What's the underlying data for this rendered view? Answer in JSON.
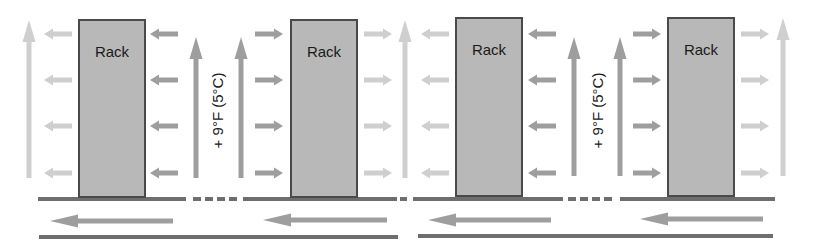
{
  "diagram": {
    "colors": {
      "rack_fill": "#b8b8b8",
      "rack_border": "#4a4a4a",
      "arrow_dark": "#9e9e9e",
      "arrow_light": "#cfcfcf",
      "floor_line": "#6e6e6e"
    },
    "racks": [
      {
        "label": "Rack",
        "x": 78,
        "y": 19,
        "w": 68,
        "h": 179,
        "intake_side": "right",
        "exhaust_side": "left"
      },
      {
        "label": "Rack",
        "x": 290,
        "y": 19,
        "w": 68,
        "h": 179,
        "intake_side": "left",
        "exhaust_side": "right"
      },
      {
        "label": "Rack",
        "x": 455,
        "y": 17,
        "w": 68,
        "h": 180,
        "intake_side": "right",
        "exhaust_side": "left"
      },
      {
        "label": "Rack",
        "x": 667,
        "y": 17,
        "w": 68,
        "h": 180,
        "intake_side": "left",
        "exhaust_side": "right"
      }
    ],
    "temperature_labels": [
      {
        "text": "+ 9°F (5°C)",
        "cx": 218,
        "cy": 110
      },
      {
        "text": "+ 9°F (5°C)",
        "cx": 598,
        "cy": 110
      }
    ],
    "horizontal_arrows": {
      "rows_y": [
        34,
        80,
        126,
        173
      ],
      "groups": [
        {
          "x1": 72,
          "x2": 44,
          "shade": "light",
          "direction": "left"
        },
        {
          "x1": 178,
          "x2": 150,
          "shade": "dark",
          "direction": "left"
        },
        {
          "x1": 255,
          "x2": 283,
          "shade": "dark",
          "direction": "right"
        },
        {
          "x1": 364,
          "x2": 392,
          "shade": "light",
          "direction": "right"
        },
        {
          "x1": 449,
          "x2": 421,
          "shade": "light",
          "direction": "left"
        },
        {
          "x1": 556,
          "x2": 528,
          "shade": "dark",
          "direction": "left"
        },
        {
          "x1": 633,
          "x2": 661,
          "shade": "dark",
          "direction": "right"
        },
        {
          "x1": 741,
          "x2": 769,
          "shade": "light",
          "direction": "right"
        }
      ]
    },
    "vertical_arrows": [
      {
        "x": 29,
        "y_bottom": 178,
        "y_top": 20,
        "shade": "light"
      },
      {
        "x": 196,
        "y_bottom": 178,
        "y_top": 37,
        "shade": "dark"
      },
      {
        "x": 241,
        "y_bottom": 178,
        "y_top": 37,
        "shade": "dark"
      },
      {
        "x": 405,
        "y_bottom": 178,
        "y_top": 20,
        "shade": "light"
      },
      {
        "x": 574,
        "y_bottom": 176,
        "y_top": 37,
        "shade": "dark"
      },
      {
        "x": 620,
        "y_bottom": 176,
        "y_top": 37,
        "shade": "dark"
      },
      {
        "x": 783,
        "y_bottom": 176,
        "y_top": 18,
        "shade": "light"
      }
    ],
    "floor": {
      "y": 199,
      "solid_segments": [
        [
          38,
          186
        ],
        [
          243,
          397
        ],
        [
          413,
          563
        ],
        [
          620,
          775
        ]
      ],
      "dashes": [
        [
          193,
          201
        ],
        [
          205,
          213
        ],
        [
          217,
          225
        ],
        [
          229,
          237
        ],
        [
          400,
          407
        ],
        [
          568,
          576
        ],
        [
          580,
          588
        ],
        [
          592,
          600
        ],
        [
          604,
          612
        ]
      ]
    },
    "underfloor_arrows": [
      {
        "x1": 173,
        "x2": 50,
        "y": 221
      },
      {
        "x1": 387,
        "x2": 263,
        "y": 220
      },
      {
        "x1": 551,
        "x2": 428,
        "y": 220
      },
      {
        "x1": 763,
        "x2": 640,
        "y": 219
      }
    ],
    "base_lines": [
      {
        "x1": 39,
        "x2": 398,
        "y": 237
      },
      {
        "x1": 418,
        "x2": 773,
        "y": 236
      }
    ]
  }
}
